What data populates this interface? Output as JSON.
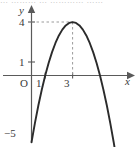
{
  "figure": {
    "name": "parabola-graph",
    "width": 139,
    "height": 147,
    "background_color": "#ffffff",
    "top_cut_text": "… ………   … ………… ……"
  },
  "axes": {
    "x_axis_label": "x",
    "y_axis_label": "y",
    "origin_label": "O",
    "axis_color": "#555555",
    "x_ticks": [
      {
        "label": "1",
        "value": 1
      },
      {
        "label": "3",
        "value": 3
      }
    ],
    "y_ticks": [
      {
        "label": "1",
        "value": 1
      },
      {
        "label": "4",
        "value": 4
      },
      {
        "label": "−5",
        "value": -5
      }
    ]
  },
  "guides": {
    "color": "#9a9a9a",
    "style": "dashed",
    "horizontal_from_y_axis_to_vertex": true,
    "vertical_from_vertex_to_x_axis": true
  },
  "chart_data": {
    "type": "line",
    "title": "",
    "xlabel": "x",
    "ylabel": "y",
    "grid": false,
    "legend": "none",
    "curve_color": "#2b2b2b",
    "equation": "y = -(x - 3)^2 + 4",
    "vertex": [
      3,
      4
    ],
    "roots": [
      1,
      5
    ],
    "y_intercept": -5,
    "opens": "down",
    "xlim": [
      -0.8,
      7.5
    ],
    "ylim": [
      -5.6,
      4.9
    ],
    "x": [
      0.0,
      0.25,
      0.5,
      0.75,
      1.0,
      1.25,
      1.5,
      1.75,
      2.0,
      2.25,
      2.5,
      2.75,
      3.0,
      3.25,
      3.5,
      3.75,
      4.0,
      4.25,
      4.5,
      4.75,
      5.0,
      5.25,
      5.5,
      5.75,
      6.0,
      6.25,
      6.5
    ],
    "y": [
      -5.0,
      -3.5625,
      -2.25,
      -1.0625,
      0.0,
      0.9375,
      1.75,
      2.4375,
      3.0,
      3.4375,
      3.75,
      3.9375,
      4.0,
      3.9375,
      3.75,
      3.4375,
      3.0,
      2.4375,
      1.75,
      0.9375,
      0.0,
      -1.0625,
      -2.25,
      -3.5625,
      -5.0,
      -6.5625,
      -8.25
    ],
    "annotations": [
      {
        "text": "4",
        "at": [
          0,
          4
        ],
        "kind": "y-tick"
      },
      {
        "text": "1",
        "at": [
          0,
          1
        ],
        "kind": "y-tick"
      },
      {
        "text": "−5",
        "at": [
          0,
          -5
        ],
        "kind": "y-tick"
      },
      {
        "text": "1",
        "at": [
          1,
          0
        ],
        "kind": "x-tick"
      },
      {
        "text": "3",
        "at": [
          3,
          0
        ],
        "kind": "x-tick"
      },
      {
        "text": "O",
        "at": [
          0,
          0
        ],
        "kind": "origin"
      }
    ]
  }
}
